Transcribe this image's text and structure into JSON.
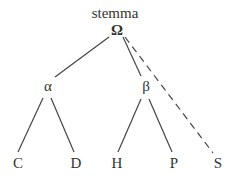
{
  "diagram": {
    "type": "stemma-tree",
    "title": "stemma",
    "colors": {
      "text": "#333333",
      "line": "#444444",
      "background": "#ffffff"
    },
    "nodes": [
      {
        "id": "omega",
        "label": "Ω",
        "x": 117,
        "y": 30
      },
      {
        "id": "alpha",
        "label": "α",
        "x": 48,
        "y": 86
      },
      {
        "id": "beta",
        "label": "β",
        "x": 146,
        "y": 86
      },
      {
        "id": "C",
        "label": "C",
        "x": 18,
        "y": 163
      },
      {
        "id": "D",
        "label": "D",
        "x": 76,
        "y": 163
      },
      {
        "id": "H",
        "label": "H",
        "x": 117,
        "y": 163
      },
      {
        "id": "P",
        "label": "P",
        "x": 174,
        "y": 163
      },
      {
        "id": "S",
        "label": "S",
        "x": 218,
        "y": 163
      }
    ],
    "edges": [
      {
        "from": "omega",
        "to": "alpha",
        "style": "solid"
      },
      {
        "from": "omega",
        "to": "beta",
        "style": "solid"
      },
      {
        "from": "omega",
        "to": "S",
        "style": "dashed"
      },
      {
        "from": "alpha",
        "to": "C",
        "style": "solid"
      },
      {
        "from": "alpha",
        "to": "D",
        "style": "solid"
      },
      {
        "from": "beta",
        "to": "H",
        "style": "solid"
      },
      {
        "from": "beta",
        "to": "P",
        "style": "solid"
      }
    ]
  }
}
